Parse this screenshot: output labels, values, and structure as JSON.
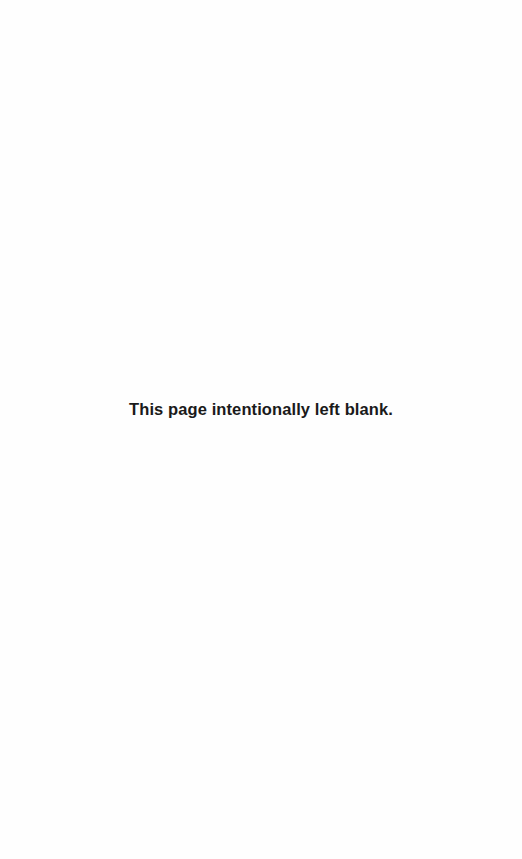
{
  "page": {
    "notice": "This page intentionally left blank."
  }
}
